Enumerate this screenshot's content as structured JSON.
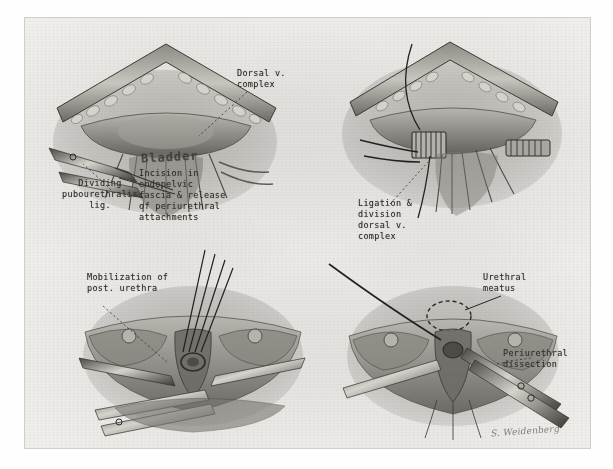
{
  "plate": {
    "title": "Radical retropubic prostatectomy surgical illustration plate",
    "signature": "S. Weidenberg",
    "paper_color": "#f0efec",
    "ink_color": "#2e2c29"
  },
  "panels": [
    {
      "id": "top-left",
      "name": "incision-in-endopelvic-fascia",
      "labels": [
        {
          "name": "label-dorsal-v-complex",
          "text": "Dorsal v.\ncomplex"
        },
        {
          "name": "label-bladder",
          "text": "Bladder"
        },
        {
          "name": "label-dividing-pubourethralis-lig",
          "text": "Dividing\npubourethralis\nlig."
        },
        {
          "name": "label-incision-endopelvic-fascia",
          "text": "Incision in\nendopelvic\nfascia & release\nof periurethral\nattachments"
        }
      ]
    },
    {
      "id": "top-right",
      "name": "ligation-and-division-dorsal-vein-complex",
      "labels": [
        {
          "name": "label-ligation-division-dorsal-v-complex",
          "text": "Ligation &\ndivision\ndorsal v.\ncomplex"
        }
      ]
    },
    {
      "id": "bottom-left",
      "name": "mobilization-of-posterior-urethra",
      "labels": [
        {
          "name": "label-mobilization-post-urethra",
          "text": "Mobilization of\npost. urethra"
        }
      ]
    },
    {
      "id": "bottom-right",
      "name": "periurethral-dissection-and-urethral-meatus",
      "labels": [
        {
          "name": "label-urethral-meatus",
          "text": "Urethral\nmeatus"
        },
        {
          "name": "label-periurethral-dissection",
          "text": "Periurethral\ndissection"
        }
      ]
    }
  ]
}
